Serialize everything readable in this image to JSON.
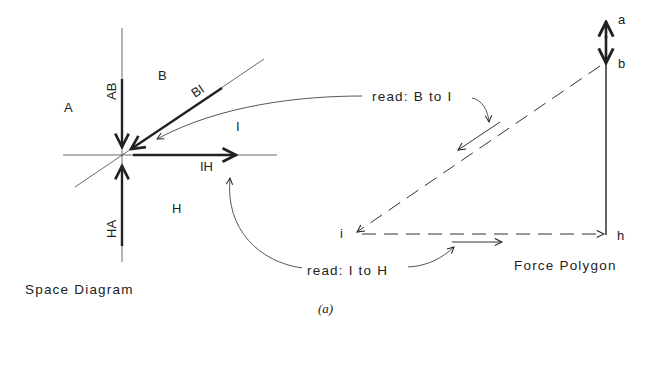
{
  "figure": {
    "caption": "(a)",
    "space_diagram": {
      "title": "Space Diagram",
      "regions": {
        "A": "A",
        "B": "B",
        "I": "I",
        "H": "H"
      },
      "members": {
        "AB": "AB",
        "BI": "BI",
        "IH": "IH",
        "HA": "HA"
      }
    },
    "force_polygon": {
      "title": "Force Polygon",
      "points": {
        "a": "a",
        "b": "b",
        "h": "h",
        "i": "i"
      }
    },
    "annotations": {
      "read_b_to_i": "read: B to I",
      "read_i_to_h": "read: I to H"
    },
    "colors": {
      "ink": "#222222",
      "background": "#ffffff"
    }
  }
}
